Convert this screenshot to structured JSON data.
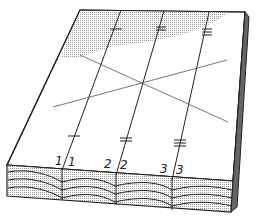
{
  "diagram": {
    "face_labels": [
      "1",
      "1",
      "2",
      "2",
      "3",
      "3"
    ],
    "colors": {
      "line": "#2a2a2a",
      "background": "#ffffff",
      "shade": "#bdbdbd"
    }
  }
}
